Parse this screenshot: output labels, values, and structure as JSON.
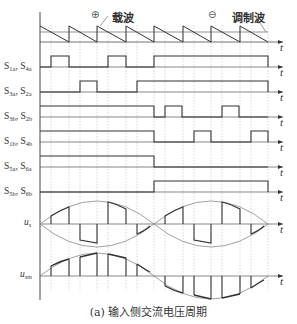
{
  "figure": {
    "caption": "(a) 输入侧交流电压周期",
    "carrier_label": "载波",
    "modulating_label": "调制波",
    "positive_symbol": "⊕",
    "negative_symbol": "⊖",
    "time_axis_label": "t",
    "rows": [
      {
        "id": "s1a_s4a",
        "label_a": "S",
        "sub_a": "1a",
        "sep": ", ",
        "label_b": "S",
        "sub_b": "4a"
      },
      {
        "id": "s3a_s2a",
        "label_a": "S",
        "sub_a": "3a",
        "sep": ", ",
        "label_b": "S",
        "sub_b": "2a"
      },
      {
        "id": "s3b_s2b",
        "label_a": "S",
        "sub_a": "3b",
        "sep": ", ",
        "label_b": "S",
        "sub_b": "2b"
      },
      {
        "id": "s1b_s4b",
        "label_a": "S",
        "sub_a": "1b",
        "sep": ", ",
        "label_b": "S",
        "sub_b": "4b"
      },
      {
        "id": "s5a_s6a",
        "label_a": "S",
        "sub_a": "5a",
        "sep": ", ",
        "label_b": "S",
        "sub_b": "6a"
      },
      {
        "id": "s5b_s6b",
        "label_a": "S",
        "sub_a": "5b",
        "sep": ", ",
        "label_b": "S",
        "sub_b": "6b"
      }
    ],
    "us_label": "u",
    "us_sub": "s",
    "um_label": "u",
    "um_sub": "sm"
  },
  "colors": {
    "line": "#333333",
    "grid": "#b0b0b0",
    "envelope": "#888888"
  }
}
